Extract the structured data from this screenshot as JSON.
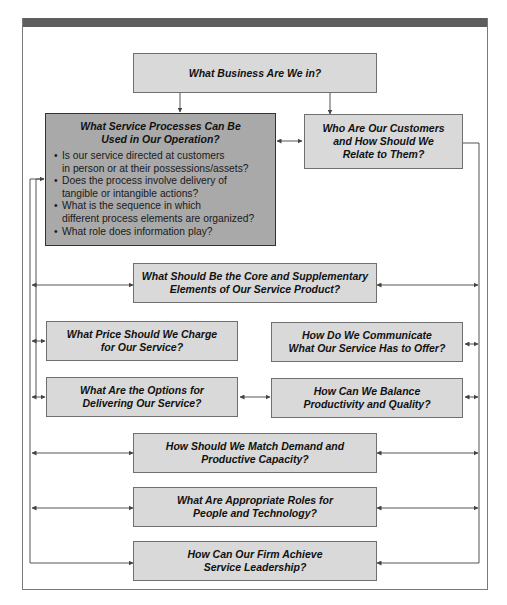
{
  "diagram": {
    "nodes": {
      "business": "What Business Are We in?",
      "processes_title": "What Service Processes Can Be\nUsed in Our Operation?",
      "processes_bullets": [
        "Is our service directed at customers\nin person or at their possessions/assets?",
        "Does the process involve delivery of\ntangible or intangible actions?",
        "What is the sequence in which\ndifferent process elements are organized?",
        "What role does information play?"
      ],
      "customers": "Who Are Our Customers\nand How Should We\nRelate to Them?",
      "core": "What Should Be the Core and Supplementary\nElements of Our Service Product?",
      "price": "What Price Should We Charge\nfor Our Service?",
      "communicate": "How Do We Communicate\nWhat Our Service Has to Offer?",
      "delivering": "What Are the Options for\nDelivering Our Service?",
      "productivity": "How Can We Balance\nProductivity and Quality?",
      "demand": "How Should We Match Demand and\nProductive Capacity?",
      "people": "What Are Appropriate Roles for\nPeople and Technology?",
      "leadership": "How Can Our Firm Achieve\nService Leadership?"
    },
    "edges": [
      {
        "from": "business",
        "to": "processes"
      },
      {
        "from": "business",
        "to": "customers"
      },
      {
        "from": "processes",
        "to": "customers",
        "bidirectional": true
      },
      {
        "from": "delivering",
        "to": "productivity",
        "bidirectional": true
      },
      {
        "from": "left-bus",
        "to": "core"
      },
      {
        "from": "left-bus",
        "to": "price"
      },
      {
        "from": "left-bus",
        "to": "delivering"
      },
      {
        "from": "left-bus",
        "to": "demand"
      },
      {
        "from": "left-bus",
        "to": "people"
      },
      {
        "from": "left-bus",
        "to": "leadership"
      },
      {
        "from": "right-bus",
        "to": "customers"
      },
      {
        "from": "right-bus",
        "to": "core"
      },
      {
        "from": "right-bus",
        "to": "communicate"
      },
      {
        "from": "right-bus",
        "to": "productivity"
      },
      {
        "from": "right-bus",
        "to": "demand"
      },
      {
        "from": "right-bus",
        "to": "people"
      },
      {
        "from": "right-bus",
        "to": "leadership"
      }
    ],
    "colors": {
      "box_fill": "#d9d9d9",
      "highlight_box_fill": "#a9a9a9",
      "header_bar": "#5e5e5e",
      "line": "#555555"
    }
  }
}
